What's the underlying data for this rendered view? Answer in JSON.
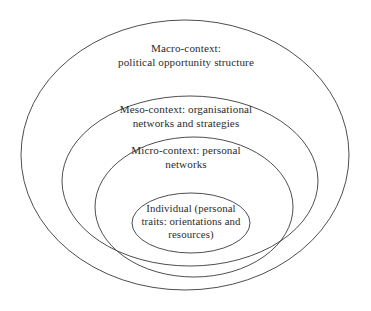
{
  "figure": {
    "type": "nested-ellipse-diagram",
    "background_color": "#ffffff",
    "stroke_color": "#3a3a3a",
    "text_color": "#2b2b2b",
    "layers": [
      {
        "id": "macro",
        "label": "Macro-context:\npolitical opportunity structure",
        "lines": [
          "Macro-context:",
          "political opportunity structure"
        ],
        "level": 1,
        "ellipse": {
          "cx": 185,
          "cy": 155,
          "rx": 164,
          "ry": 135
        }
      },
      {
        "id": "meso",
        "label": "Meso-context: organisational\nnetworks and strategies",
        "lines": [
          "Meso-context: organisational",
          "networks and strategies"
        ],
        "level": 2,
        "ellipse": {
          "cx": 190,
          "cy": 181,
          "rx": 128,
          "ry": 85
        }
      },
      {
        "id": "micro",
        "label": "Micro-context: personal\nnetworks",
        "lines": [
          "Micro-context: personal",
          "networks"
        ],
        "level": 3,
        "ellipse": {
          "cx": 194,
          "cy": 207,
          "rx": 99,
          "ry": 70
        }
      },
      {
        "id": "individual",
        "label": "Individual (personal\ntraits: orientations and\nresources)",
        "lines": [
          "Individual (personal",
          "traits: orientations and",
          "resources)"
        ],
        "level": 4,
        "ellipse": {
          "cx": 191,
          "cy": 223,
          "rx": 59,
          "ry": 30
        }
      }
    ]
  }
}
